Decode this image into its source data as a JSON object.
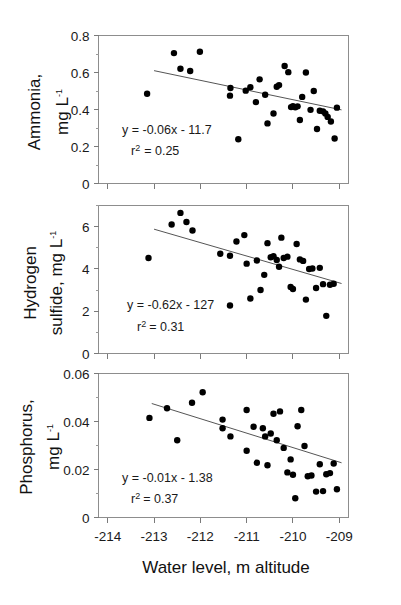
{
  "figure": {
    "xlabel": "Water level, m altitude",
    "xlim": [
      -214.2,
      -208.8
    ],
    "xticks": [
      -214,
      -213,
      -212,
      -211,
      -210,
      -209
    ],
    "xticklabels": [
      "-214",
      "-213",
      "-212",
      "-211",
      "-210",
      "-209"
    ],
    "marker_color": "#000000",
    "fitline_color": "#555555",
    "axis_color": "#7a7a7a"
  },
  "chart_data": [
    {
      "type": "scatter",
      "panel": "a",
      "title": "",
      "ylabel": "Ammonia, mg L-1",
      "ylabel_line1": "Ammonia,",
      "ylabel_line2": "mg L",
      "ylabel_sup": "-1",
      "xlabel": "Water level, m altitude",
      "ylim": [
        0,
        0.8
      ],
      "yticks": [
        0,
        0.2,
        0.4,
        0.6,
        0.8
      ],
      "yticklabels": [
        "0",
        "0.2",
        "0.4",
        "0.6",
        "0.8"
      ],
      "grid": false,
      "equation": "y = -0.06x - 11.7",
      "r2_label": "r",
      "r2_sup": "2",
      "r2_value": "= 0.25",
      "r2": 0.25,
      "slope": -0.06,
      "intercept": -11.7,
      "fit_x": [
        -213.0,
        -208.95
      ],
      "fit_y": [
        0.61,
        0.398
      ],
      "x": [
        -213.15,
        -212.57,
        -212.43,
        -212.22,
        -212.01,
        -211.35,
        -211.36,
        -211.18,
        -211.02,
        -210.92,
        -210.8,
        -210.72,
        -210.6,
        -210.55,
        -210.42,
        -210.35,
        -210.3,
        -210.18,
        -210.1,
        -210.04,
        -210.0,
        -209.95,
        -209.9,
        -209.85,
        -209.8,
        -209.72,
        -209.62,
        -209.55,
        -209.48,
        -209.42,
        -209.35,
        -209.3,
        -209.25,
        -209.18,
        -209.1,
        -209.05
      ],
      "y": [
        0.485,
        0.705,
        0.62,
        0.608,
        0.712,
        0.516,
        0.475,
        0.239,
        0.502,
        0.52,
        0.44,
        0.563,
        0.48,
        0.325,
        0.378,
        0.523,
        0.532,
        0.635,
        0.602,
        0.413,
        0.418,
        0.412,
        0.417,
        0.343,
        0.468,
        0.6,
        0.398,
        0.5,
        0.295,
        0.393,
        0.39,
        0.378,
        0.36,
        0.335,
        0.243,
        0.41
      ]
    },
    {
      "type": "scatter",
      "panel": "b",
      "title": "",
      "ylabel": "Hydrogen sulfide, mg L-1",
      "ylabel_line1": "Hydrogen",
      "ylabel_line2": "sulfide, mg L",
      "ylabel_sup": "-1",
      "xlabel": "Water level, m altitude",
      "ylim": [
        0,
        7
      ],
      "yticks": [
        0,
        2,
        4,
        6
      ],
      "yticklabels": [
        "0",
        "2",
        "4",
        "6"
      ],
      "grid": false,
      "equation": "y = -0.62x - 127",
      "r2_label": "r",
      "r2_sup": "2",
      "r2_value": "= 0.31",
      "r2": 0.31,
      "slope": -0.62,
      "intercept": -127,
      "fit_x": [
        -213.0,
        -208.95
      ],
      "fit_y": [
        5.88,
        3.31
      ],
      "x": [
        -213.12,
        -212.62,
        -212.43,
        -212.3,
        -212.17,
        -211.57,
        -211.36,
        -211.36,
        -211.22,
        -211.05,
        -211.0,
        -210.92,
        -210.78,
        -210.7,
        -210.62,
        -210.55,
        -210.48,
        -210.42,
        -210.35,
        -210.3,
        -210.25,
        -210.2,
        -210.12,
        -210.05,
        -210.0,
        -209.92,
        -209.85,
        -209.78,
        -209.72,
        -209.65,
        -209.58,
        -209.5,
        -209.42,
        -209.35,
        -209.28,
        -209.2,
        -209.12
      ],
      "y": [
        4.52,
        6.1,
        6.65,
        6.22,
        5.82,
        4.72,
        4.62,
        2.27,
        5.3,
        5.6,
        4.25,
        2.6,
        4.4,
        3.0,
        3.72,
        5.22,
        4.55,
        4.6,
        4.42,
        4.1,
        5.48,
        4.52,
        4.58,
        3.15,
        3.05,
        5.18,
        4.45,
        4.38,
        2.55,
        4.0,
        4.02,
        3.1,
        4.05,
        3.28,
        1.78,
        3.25,
        3.3
      ]
    },
    {
      "type": "scatter",
      "panel": "c",
      "title": "",
      "ylabel": "Phosphorus, mg L-1",
      "ylabel_line1": "Phosphorus,",
      "ylabel_line2": "mg L",
      "ylabel_sup": "-1",
      "xlabel": "Water level, m altitude",
      "ylim": [
        0,
        0.06
      ],
      "yticks": [
        0,
        0.02,
        0.04,
        0.06
      ],
      "yticklabels": [
        "0",
        "0.02",
        "0.04",
        "0.06"
      ],
      "grid": false,
      "equation": "y = -0.01x - 1.38",
      "r2_label": "r",
      "r2_sup": "2",
      "r2_value": "= 0.37",
      "r2": 0.37,
      "slope": -0.01,
      "intercept": -1.38,
      "fit_x": [
        -213.05,
        "-208.95"
      ],
      "fit_y": [
        0.0475,
        0.0228
      ],
      "x": [
        -213.1,
        -212.72,
        -212.5,
        -212.18,
        -211.95,
        -211.52,
        -211.52,
        -211.35,
        -211.0,
        -211.0,
        -210.85,
        -210.78,
        -210.65,
        -210.6,
        -210.55,
        -210.48,
        -210.42,
        -210.35,
        -210.28,
        -210.2,
        -210.12,
        -210.05,
        -210.0,
        -209.95,
        -209.9,
        -209.82,
        -209.75,
        -209.68,
        -209.6,
        -209.5,
        -209.42,
        -209.35,
        -209.28,
        -209.2,
        -209.12,
        -209.05
      ],
      "y": [
        0.0415,
        0.0455,
        0.0322,
        0.0478,
        0.0522,
        0.0408,
        0.0372,
        0.0338,
        0.0448,
        0.0278,
        0.0378,
        0.0228,
        0.0372,
        0.0338,
        0.0218,
        0.035,
        0.0432,
        0.0322,
        0.0442,
        0.029,
        0.0188,
        0.0242,
        0.0178,
        0.008,
        0.038,
        0.0448,
        0.0298,
        0.0172,
        0.0175,
        0.0108,
        0.0222,
        0.011,
        0.018,
        0.0185,
        0.0225,
        0.0118
      ]
    }
  ]
}
